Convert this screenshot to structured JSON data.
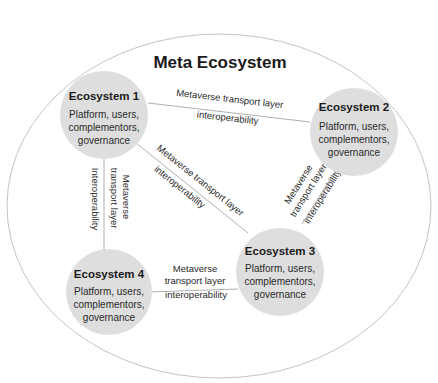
{
  "diagram": {
    "title": "Meta Ecosystem",
    "colors": {
      "outer_ellipse_stroke": "#bdbdbd",
      "node_fill": "#dedede",
      "line": "#b0b0b0",
      "text": "#1a1a1a"
    },
    "nodes": [
      {
        "id": "eco1",
        "title": "Ecosystem 1",
        "desc": [
          "Platform, users,",
          "complementors,",
          "governance"
        ]
      },
      {
        "id": "eco2",
        "title": "Ecosystem 2",
        "desc": [
          "Platform, users,",
          "complementors,",
          "governance"
        ]
      },
      {
        "id": "eco3",
        "title": "Ecosystem 3",
        "desc": [
          "Platform, users,",
          "complementors,",
          "governance"
        ]
      },
      {
        "id": "eco4",
        "title": "Ecosystem 4",
        "desc": [
          "Platform, users,",
          "complementors,",
          "governance"
        ]
      }
    ],
    "links": [
      {
        "from": "eco1",
        "to": "eco2",
        "label_a": "Metaverse transport layer",
        "label_b": "interoperability"
      },
      {
        "from": "eco1",
        "to": "eco3",
        "label_a": "Metaverse transport layer",
        "label_b": "interoperability"
      },
      {
        "from": "eco1",
        "to": "eco4",
        "label_a": "Metaverse",
        "label_b": "transport layer",
        "label_c": "Interoperability"
      },
      {
        "from": "eco2",
        "to": "eco3",
        "label_a": "Metaverse",
        "label_b": "transport layer",
        "label_c": "interoperability"
      },
      {
        "from": "eco4",
        "to": "eco3",
        "label_a": "Metaverse",
        "label_b": "transport layer",
        "label_c": "interoperability"
      }
    ]
  }
}
